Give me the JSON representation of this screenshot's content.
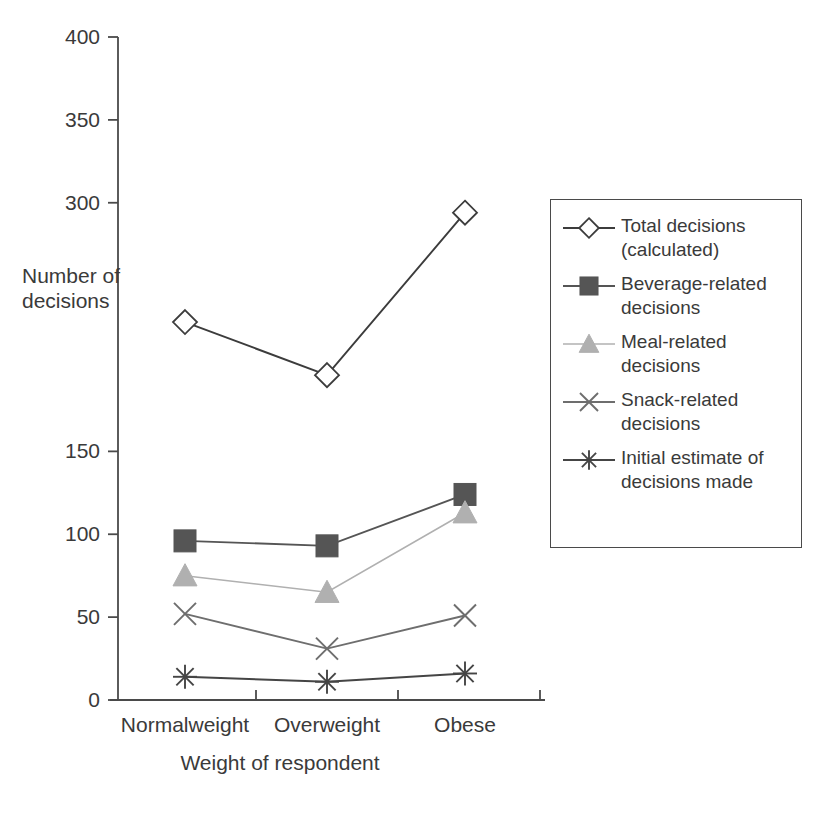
{
  "chart_data": {
    "type": "line",
    "title": "",
    "xlabel": "Weight of respondent",
    "ylabel": "Number of decisions",
    "categories": [
      "Normalweight",
      "Overweight",
      "Obese"
    ],
    "ylim": [
      0,
      400
    ],
    "yticks": [
      0,
      50,
      100,
      150,
      200,
      250,
      300,
      350,
      400
    ],
    "ytick_labels_visible": [
      "0",
      "50",
      "100",
      "150",
      "300",
      "350",
      "400"
    ],
    "grid": false,
    "legend_position": "right",
    "series": [
      {
        "name": "Total decisions (calculated)",
        "marker": "diamond-open",
        "color": "#3c3c3c",
        "values": [
          228,
          196,
          294
        ]
      },
      {
        "name": "Beverage-related decisions",
        "marker": "square-filled",
        "color": "#555555",
        "values": [
          96,
          93,
          124
        ]
      },
      {
        "name": "Meal-related decisions",
        "marker": "triangle-filled",
        "color": "#b0b0b0",
        "values": [
          75,
          65,
          113
        ]
      },
      {
        "name": "Snack-related decisions",
        "marker": "x-cross",
        "color": "#6e6e6e",
        "values": [
          52,
          31,
          51
        ]
      },
      {
        "name": "Initial estimate of decisions made",
        "marker": "asterisk",
        "color": "#454545",
        "values": [
          14,
          11,
          16
        ]
      }
    ]
  },
  "axes": {
    "y_title_line1": "Number of",
    "y_title_line2": "decisions",
    "x_title": "Weight of respondent",
    "y_ticks": [
      {
        "label": "400",
        "value": 400
      },
      {
        "label": "350",
        "value": 350
      },
      {
        "label": "300",
        "value": 300
      },
      {
        "label": "150",
        "value": 150
      },
      {
        "label": "100",
        "value": 100
      },
      {
        "label": "50",
        "value": 50
      },
      {
        "label": "0",
        "value": 0
      }
    ],
    "x_ticks": [
      {
        "label": "Normalweight"
      },
      {
        "label": "Overweight"
      },
      {
        "label": "Obese"
      }
    ]
  },
  "legend": {
    "items": [
      {
        "line1": "Total decisions",
        "line2": "(calculated)",
        "marker": "diamond-open-icon"
      },
      {
        "line1": "Beverage-related",
        "line2": "decisions",
        "marker": "square-filled-icon"
      },
      {
        "line1": "Meal-related",
        "line2": "decisions",
        "marker": "triangle-filled-icon"
      },
      {
        "line1": "Snack-related",
        "line2": "decisions",
        "marker": "x-cross-icon"
      },
      {
        "line1": "Initial estimate of",
        "line2": "decisions made",
        "marker": "asterisk-icon"
      }
    ]
  },
  "colors": {
    "axis": "#4a4a4a",
    "text": "#3a3a3a",
    "total": "#3c3c3c",
    "beverage": "#555555",
    "meal": "#b0b0b0",
    "snack": "#6e6e6e",
    "initial": "#454545"
  }
}
